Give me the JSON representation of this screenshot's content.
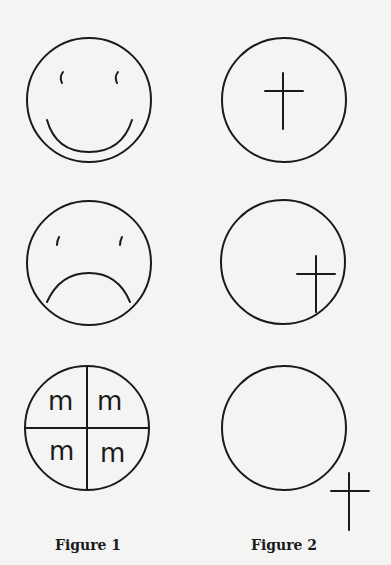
{
  "figures": [
    {
      "caption": "Figure 1",
      "panels": [
        {
          "name": "smiling-face",
          "description": "circle with two eyes and upward-curving smile"
        },
        {
          "name": "frowning-face",
          "description": "circle with two eyes and downward-curving frown"
        },
        {
          "name": "quartered-circle",
          "description": "circle divided into four quadrants each containing the letter m",
          "quadrant_letters": [
            "m",
            "m",
            "m",
            "m"
          ]
        }
      ]
    },
    {
      "caption": "Figure 2",
      "panels": [
        {
          "name": "cross-centered",
          "description": "cross inside the circle at center"
        },
        {
          "name": "cross-lower-right-inside",
          "description": "cross inside the circle near lower right edge"
        },
        {
          "name": "cross-outside",
          "description": "cross outside the circle at lower right"
        }
      ]
    }
  ],
  "colors": {
    "background": "#f4f4f2",
    "ink": "#1a1a1a"
  }
}
